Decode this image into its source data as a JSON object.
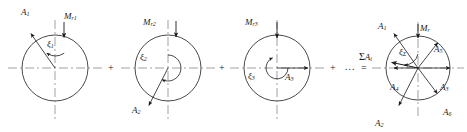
{
  "figure": {
    "kind": "harmonic-phasor-decomposition",
    "stroke_color": "#1a1a1a",
    "axis_color": "#6e6e6e",
    "background": "#ffffff",
    "width": 467,
    "height": 132
  },
  "operators": {
    "plus_1": "+",
    "plus_2": "+",
    "plus_3": "+",
    "ellipsis": "...",
    "equals": "="
  },
  "circles": [
    {
      "id": "harmonic-1",
      "cx": 55,
      "cy": 68,
      "r": 33,
      "amplitude_label": "A",
      "amplitude_sub": "1",
      "amplitude_angle_deg": 125,
      "amplitude_len": 42,
      "reference_label": "M",
      "reference_sub": "r1",
      "angle_label": "ξ",
      "angle_sub": "1",
      "angle_arc_start_deg": 90,
      "angle_arc_end_deg": 125,
      "angle_arc_radius": 16
    },
    {
      "id": "harmonic-2",
      "cx": 168,
      "cy": 68,
      "r": 33,
      "amplitude_label": "A",
      "amplitude_sub": "2",
      "amplitude_angle_deg": 243,
      "amplitude_len": 42,
      "reference_label": "M",
      "reference_sub": "r2",
      "angle_label": "ξ",
      "angle_sub": "2",
      "angle_arc_start_deg": 90,
      "angle_arc_end_deg": 243,
      "angle_arc_radius": 13
    },
    {
      "id": "harmonic-3",
      "cx": 277,
      "cy": 68,
      "r": 33,
      "amplitude_label": "A",
      "amplitude_sub": "3",
      "amplitude_angle_deg": 0,
      "amplitude_len": 33,
      "reference_label": "M",
      "reference_sub": "r3",
      "angle_label": "ξ",
      "angle_sub": "3",
      "angle_arc_start_deg": 90,
      "angle_arc_end_deg": 360,
      "angle_arc_radius": 11
    }
  ],
  "sum_circle": {
    "id": "resultant",
    "cx": 418,
    "cy": 68,
    "r": 32,
    "reference_label": "M",
    "reference_sub": "r",
    "sum_label_sigma": "Σ",
    "sum_label_a": "A",
    "sum_label_sub": "i",
    "sum_angle_label": "ξ",
    "sum_angle_sub": "Σ",
    "sum_vector_angle_deg": 168,
    "sum_vector_len": 27,
    "angle_arc_radius": 14,
    "vectors": [
      {
        "label": "A",
        "sub": "1",
        "angle_deg": 125,
        "len": 42,
        "lx": 378,
        "ly": 22
      },
      {
        "label": "A",
        "sub": "2",
        "angle_deg": 243,
        "len": 42,
        "lx": 375,
        "ly": 119
      },
      {
        "label": "A",
        "sub": "3",
        "angle_deg": 0,
        "len": 32,
        "lx": 440,
        "ly": 83
      },
      {
        "label": "A",
        "sub": "4",
        "angle_deg": 180,
        "len": 24,
        "lx": 390,
        "ly": 83
      },
      {
        "label": "A",
        "sub": "5",
        "angle_deg": 52,
        "len": 32,
        "lx": 434,
        "ly": 48
      },
      {
        "label": "A",
        "sub": "6",
        "angle_deg": 307,
        "len": 32,
        "lx": 443,
        "ly": 110
      }
    ]
  }
}
